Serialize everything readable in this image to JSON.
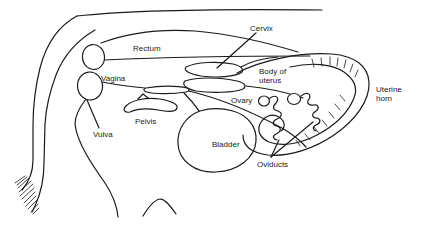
{
  "figure": {
    "background_color": "#ffffff",
    "ink_color": "#1a1a1a",
    "labels": {
      "cervix": "Cervix",
      "rectum": "Rectum",
      "vagina": "Vagina",
      "body_of_uterus_line1": "Body of",
      "body_of_uterus_line2": "uterus",
      "uterine_horn_line1": "Uterine",
      "uterine_horn_line2": "horn",
      "ovary": "Ovary",
      "vulva": "Vulva",
      "pelvis": "Pelvis",
      "bladder": "Bladder",
      "oviducts": "Oviducts"
    }
  }
}
